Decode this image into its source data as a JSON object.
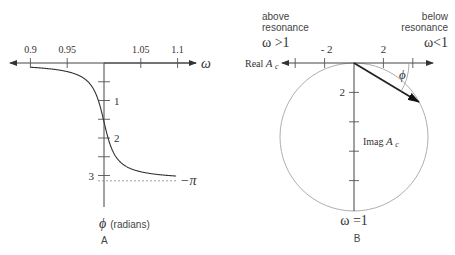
{
  "panelA": {
    "caption": "A",
    "x_axis": {
      "label": "ω",
      "tick_labels": [
        "0.9",
        "0.95",
        "1.05",
        "1.1"
      ],
      "tick_values": [
        0.9,
        0.95,
        1.05,
        1.1
      ],
      "origin_value": 1.0,
      "range": [
        0.88,
        1.125
      ]
    },
    "y_axis": {
      "label_symbol": "ϕ",
      "label_unit": "(radians)",
      "tick_labels": [
        "1",
        "2",
        "3"
      ],
      "tick_values": [
        0.5,
        1,
        1.5,
        2,
        2.5,
        3
      ],
      "labeled_values": [
        1,
        2,
        3
      ],
      "range": [
        0,
        3.3
      ]
    },
    "asymptote_label": "−π",
    "asymptote_value": 3.14159,
    "damping_ratio": 0.012
  },
  "panelB": {
    "caption": "B",
    "top_left_text": [
      "above",
      "resonance"
    ],
    "top_left_condition": "ω >1",
    "top_right_text": [
      "below",
      "resonance"
    ],
    "top_right_condition": "ω<1",
    "real_axis_label_prefix": "Real ",
    "real_axis_label_symbol": "A",
    "real_axis_label_sub": "c",
    "imag_axis_label_prefix": "Imag ",
    "imag_axis_label_symbol": "A",
    "imag_axis_label_sub": "c",
    "real_tick_labels": [
      "- 2",
      "2"
    ],
    "real_tick_values": [
      -4,
      -2,
      2,
      4
    ],
    "imag_tick_label": "2",
    "imag_tick_values": [
      2,
      4,
      6,
      8
    ],
    "bottom_label": "ω =1",
    "angle_label": "ϕ",
    "circle_diameter": 10,
    "vector_angle_deg": 31
  }
}
